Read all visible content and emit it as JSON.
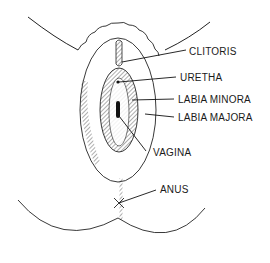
{
  "diagram": {
    "type": "anatomical-line-drawing",
    "labels": [
      {
        "id": "clitoris",
        "text": "CLITORIS",
        "x": 189,
        "y": 46
      },
      {
        "id": "uretha",
        "text": "URETHA",
        "x": 180,
        "y": 72
      },
      {
        "id": "labia-minora",
        "text": "LABIA MINORA",
        "x": 178,
        "y": 94
      },
      {
        "id": "labia-majora",
        "text": "LABIA MAJORA",
        "x": 178,
        "y": 112
      },
      {
        "id": "vagina",
        "text": "VAGINA",
        "x": 153,
        "y": 147
      },
      {
        "id": "anus",
        "text": "ANUS",
        "x": 160,
        "y": 184
      }
    ],
    "colors": {
      "line": "#1a1a1a",
      "background": "#ffffff"
    }
  }
}
